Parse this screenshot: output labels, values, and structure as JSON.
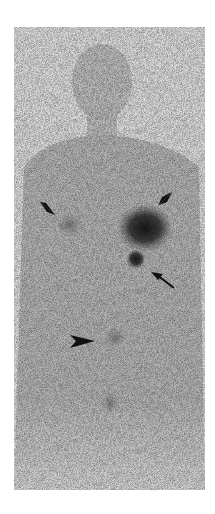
{
  "image": {
    "type": "scintigraphy-whole-body-anterior",
    "background": "#ffffff",
    "film_base": "#d6d6d6",
    "uptake_color": "#1a1a1a"
  },
  "markers": [
    {
      "kind": "arrowhead",
      "label": "",
      "x": 48,
      "y": 208,
      "direction": "down-right"
    },
    {
      "kind": "arrowhead",
      "label": "",
      "x": 165,
      "y": 198,
      "direction": "down-left"
    },
    {
      "kind": "arrow",
      "label": "",
      "x": 163,
      "y": 282,
      "direction": "up-left"
    },
    {
      "kind": "arrowhead",
      "label": "",
      "x": 82,
      "y": 341,
      "direction": "right"
    }
  ],
  "hotspots": [
    {
      "name": "large-left-upper-uptake",
      "x": 145,
      "y": 228,
      "r": 22
    },
    {
      "name": "small-focal-uptake",
      "x": 136,
      "y": 259,
      "r": 8
    },
    {
      "name": "right-faint-uptake",
      "x": 70,
      "y": 225,
      "r": 12
    },
    {
      "name": "pelvic-uptake",
      "x": 115,
      "y": 338,
      "r": 10
    },
    {
      "name": "lower-faint-uptake",
      "x": 110,
      "y": 403,
      "r": 8
    }
  ]
}
